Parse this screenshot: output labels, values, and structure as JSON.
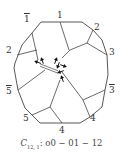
{
  "diagram": {
    "type": "polygonal-domain-diagram",
    "outer_polygon": [
      [
        41,
        22
      ],
      [
        82,
        22
      ],
      [
        93,
        30
      ],
      [
        102,
        40
      ],
      [
        107,
        55
      ],
      [
        108,
        75
      ],
      [
        105,
        90
      ],
      [
        102,
        107
      ],
      [
        90,
        117
      ],
      [
        80,
        123
      ],
      [
        40,
        123
      ],
      [
        25,
        108
      ],
      [
        18,
        90
      ],
      [
        14,
        68
      ],
      [
        15,
        63
      ],
      [
        22,
        45
      ],
      [
        32,
        33
      ]
    ],
    "inner_lines": [
      [
        [
          60,
          22
        ],
        [
          69,
          50
        ]
      ],
      [
        [
          93,
          30
        ],
        [
          87,
          43
        ],
        [
          107,
          55
        ]
      ],
      [
        [
          87,
          43
        ],
        [
          70,
          50
        ],
        [
          62,
          58
        ]
      ],
      [
        [
          32,
          33
        ],
        [
          38,
          60
        ]
      ],
      [
        [
          17,
          55
        ],
        [
          37,
          50
        ]
      ],
      [
        [
          18,
          90
        ],
        [
          45,
          70
        ]
      ],
      [
        [
          105,
          90
        ],
        [
          83,
          100
        ],
        [
          90,
          117
        ]
      ],
      [
        [
          83,
          100
        ],
        [
          62,
          72
        ]
      ],
      [
        [
          32,
          115
        ],
        [
          50,
          107
        ],
        [
          62,
          123
        ]
      ],
      [
        [
          50,
          107
        ],
        [
          60,
          80
        ]
      ]
    ],
    "double_line": [
      [
        40,
        65
      ],
      [
        58,
        72
      ]
    ],
    "arrows": [
      {
        "x": 37,
        "y": 62,
        "angle": 200
      },
      {
        "x": 42,
        "y": 60,
        "angle": 250
      },
      {
        "x": 56,
        "y": 60,
        "angle": 290
      },
      {
        "x": 60,
        "y": 72,
        "angle": 160
      },
      {
        "x": 64,
        "y": 66,
        "angle": 20
      },
      {
        "x": 58,
        "y": 66,
        "angle": 110
      },
      {
        "x": 62,
        "y": 78,
        "angle": 250
      }
    ],
    "stroke_color": "#444444",
    "labels": [
      {
        "text": "1",
        "overline": false,
        "x": 57,
        "y": 11
      },
      {
        "text": "1",
        "overline": true,
        "x": 24,
        "y": 15
      },
      {
        "text": "2",
        "overline": false,
        "x": 94,
        "y": 23
      },
      {
        "text": "2",
        "overline": false,
        "x": 6,
        "y": 46
      },
      {
        "text": "3",
        "overline": false,
        "x": 109,
        "y": 48
      },
      {
        "text": "3",
        "overline": true,
        "x": 109,
        "y": 86
      },
      {
        "text": "5",
        "overline": true,
        "x": 6,
        "y": 87
      },
      {
        "text": "5",
        "overline": false,
        "x": 23,
        "y": 114
      },
      {
        "text": "4",
        "overline": false,
        "x": 59,
        "y": 126
      },
      {
        "text": "4",
        "overline": false,
        "x": 90,
        "y": 114
      }
    ]
  },
  "caption": {
    "symbol": "C",
    "subscript": "12, 1",
    "text": ": o0 − 01 − 12"
  }
}
